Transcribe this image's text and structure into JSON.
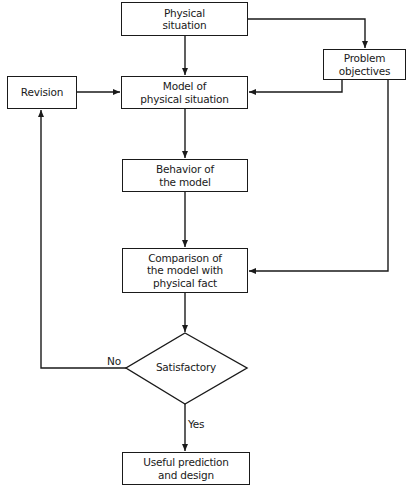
{
  "diagram": {
    "type": "flowchart",
    "nodes": {
      "physical_situation": "Physical\nsituation",
      "problem_objectives": "Problem\nobjectives",
      "revision": "Revision",
      "model": "Model of\nphysical situation",
      "behavior": "Behavior of\nthe model",
      "comparison": "Comparison of\nthe model with\nphysical fact",
      "decision": "Satisfactory",
      "useful": "Useful prediction\nand design"
    },
    "edge_labels": {
      "no": "No",
      "yes": "Yes"
    },
    "edges": [
      {
        "from": "physical_situation",
        "to": "model"
      },
      {
        "from": "physical_situation",
        "to": "problem_objectives"
      },
      {
        "from": "problem_objectives",
        "to": "model"
      },
      {
        "from": "problem_objectives",
        "to": "comparison"
      },
      {
        "from": "revision",
        "to": "model"
      },
      {
        "from": "model",
        "to": "behavior"
      },
      {
        "from": "behavior",
        "to": "comparison"
      },
      {
        "from": "comparison",
        "to": "decision"
      },
      {
        "from": "decision",
        "to": "revision",
        "label": "No"
      },
      {
        "from": "decision",
        "to": "useful",
        "label": "Yes"
      }
    ],
    "line_color": "#1a1a1a"
  }
}
